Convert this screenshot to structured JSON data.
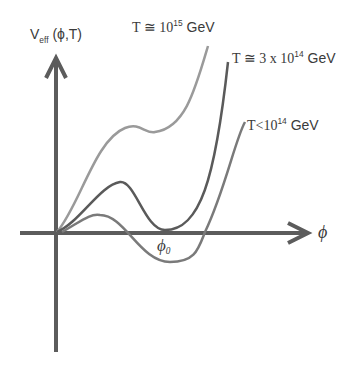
{
  "diagram": {
    "y_axis_label": {
      "main": "V",
      "sub": "eff",
      "args": "(ϕ,T)"
    },
    "x_axis_label": "ϕ",
    "x_marker_label": {
      "main": "ϕ",
      "sub": "0"
    },
    "curves": [
      {
        "name": "high-temperature",
        "label_prefix": "T ≅ 10",
        "label_exp": "15",
        "label_suffix": " GeV",
        "color": "#9a9a9a"
      },
      {
        "name": "critical-temperature",
        "label_prefix": "T ≅ 3 x 10",
        "label_exp": "14",
        "label_suffix": " GeV",
        "color": "#5a5a5a"
      },
      {
        "name": "low-temperature",
        "label_prefix": "T<10",
        "label_exp": "14",
        "label_suffix": " GeV",
        "color": "#7a7a7a"
      }
    ],
    "axis_color": "#5c5c5c"
  }
}
